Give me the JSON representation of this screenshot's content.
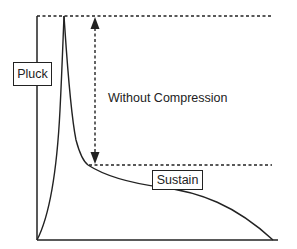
{
  "diagram": {
    "labels": {
      "pluck": "Pluck",
      "sustain": "Sustain",
      "range_annotation": "Without Compression"
    },
    "colors": {
      "stroke": "#222222",
      "background": "#ffffff"
    },
    "elements": {
      "axes": [
        "vertical-axis",
        "horizontal-axis"
      ],
      "envelope_curve": "sharp attack to peak, rapid decay, slow sustain tail to zero",
      "reference_lines": [
        "peak-level-dotted-line",
        "sustain-level-dotted-line"
      ],
      "arrow": "double-headed dotted arrow between peak and sustain levels"
    }
  }
}
